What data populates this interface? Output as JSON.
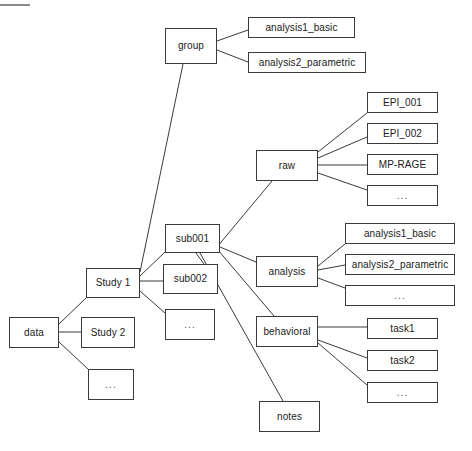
{
  "diagram": {
    "type": "tree",
    "title": "",
    "marker": {
      "name": "top-rule"
    },
    "nodes": [
      {
        "id": "data",
        "label": "data",
        "x": 9,
        "y": 317,
        "w": 50,
        "h": 31
      },
      {
        "id": "study1",
        "label": "Study 1",
        "x": 86,
        "y": 268,
        "w": 54,
        "h": 30
      },
      {
        "id": "study2",
        "label": "Study 2",
        "x": 81,
        "y": 317,
        "w": 54,
        "h": 31
      },
      {
        "id": "data-ellipsis",
        "label": "...",
        "x": 88,
        "y": 369,
        "w": 46,
        "h": 31
      },
      {
        "id": "group",
        "label": "group",
        "x": 165,
        "y": 28,
        "w": 52,
        "h": 36
      },
      {
        "id": "group-analysis1",
        "label": "analysis1_basic",
        "x": 248,
        "y": 17,
        "w": 107,
        "h": 21
      },
      {
        "id": "group-analysis2",
        "label": "analysis2_parametric",
        "x": 248,
        "y": 52,
        "w": 118,
        "h": 21
      },
      {
        "id": "sub001",
        "label": "sub001",
        "x": 165,
        "y": 224,
        "w": 55,
        "h": 29
      },
      {
        "id": "sub002",
        "label": "sub002",
        "x": 163,
        "y": 264,
        "w": 55,
        "h": 30
      },
      {
        "id": "study1-ellipsis",
        "label": "...",
        "x": 165,
        "y": 309,
        "w": 50,
        "h": 31
      },
      {
        "id": "raw",
        "label": "raw",
        "x": 256,
        "y": 150,
        "w": 62,
        "h": 31
      },
      {
        "id": "raw-epi001",
        "label": "EPI_001",
        "x": 367,
        "y": 92,
        "w": 71,
        "h": 21
      },
      {
        "id": "raw-epi002",
        "label": "EPI_002",
        "x": 367,
        "y": 123,
        "w": 71,
        "h": 21
      },
      {
        "id": "raw-mprage",
        "label": "MP-RAGE",
        "x": 367,
        "y": 154,
        "w": 71,
        "h": 21
      },
      {
        "id": "raw-ellipsis",
        "label": "...",
        "x": 367,
        "y": 185,
        "w": 71,
        "h": 21
      },
      {
        "id": "analysis",
        "label": "analysis",
        "x": 256,
        "y": 256,
        "w": 62,
        "h": 31
      },
      {
        "id": "analysis-analysis1",
        "label": "analysis1_basic",
        "x": 345,
        "y": 223,
        "w": 110,
        "h": 21
      },
      {
        "id": "analysis-analysis2",
        "label": "analysis2_parametric",
        "x": 345,
        "y": 254,
        "w": 110,
        "h": 21
      },
      {
        "id": "analysis-ellipsis",
        "label": "...",
        "x": 345,
        "y": 285,
        "w": 110,
        "h": 21
      },
      {
        "id": "behavioral",
        "label": "behavioral",
        "x": 256,
        "y": 316,
        "w": 62,
        "h": 31
      },
      {
        "id": "behavioral-task1",
        "label": "task1",
        "x": 367,
        "y": 318,
        "w": 71,
        "h": 21
      },
      {
        "id": "behavioral-task2",
        "label": "task2",
        "x": 367,
        "y": 350,
        "w": 71,
        "h": 21
      },
      {
        "id": "behavioral-ellipsis",
        "label": "...",
        "x": 367,
        "y": 382,
        "w": 71,
        "h": 21
      },
      {
        "id": "notes",
        "label": "notes",
        "x": 259,
        "y": 401,
        "w": 61,
        "h": 31
      }
    ],
    "edges": [
      {
        "from": "data",
        "to": "study1",
        "x1": 59,
        "y1": 324,
        "x2": 86,
        "y2": 298
      },
      {
        "from": "data",
        "to": "study2",
        "x1": 59,
        "y1": 332,
        "x2": 81,
        "y2": 332
      },
      {
        "from": "data",
        "to": "data-ellipsis",
        "x1": 59,
        "y1": 342,
        "x2": 88,
        "y2": 369
      },
      {
        "from": "study1",
        "to": "group",
        "x1": 140,
        "y1": 272,
        "x2": 183,
        "y2": 64
      },
      {
        "from": "study1",
        "to": "sub001",
        "x1": 140,
        "y1": 276,
        "x2": 165,
        "y2": 252
      },
      {
        "from": "study1",
        "to": "sub002",
        "x1": 140,
        "y1": 281,
        "x2": 163,
        "y2": 281
      },
      {
        "from": "study1",
        "to": "study1-ellipsis",
        "x1": 140,
        "y1": 291,
        "x2": 165,
        "y2": 313
      },
      {
        "from": "group",
        "to": "group-analysis1",
        "x1": 217,
        "y1": 41,
        "x2": 248,
        "y2": 30
      },
      {
        "from": "group",
        "to": "group-analysis2",
        "x1": 217,
        "y1": 50,
        "x2": 248,
        "y2": 62
      },
      {
        "from": "sub001",
        "to": "raw",
        "x1": 212,
        "y1": 253,
        "x2": 272,
        "y2": 181
      },
      {
        "from": "sub001",
        "to": "analysis",
        "x1": 220,
        "y1": 247,
        "x2": 256,
        "y2": 262
      },
      {
        "from": "sub001",
        "to": "behavioral",
        "x1": 218,
        "y1": 250,
        "x2": 274,
        "y2": 316
      },
      {
        "from": "sub001",
        "to": "notes",
        "x1": 200,
        "y1": 253,
        "x2": 283,
        "y2": 401
      },
      {
        "from": "sub001",
        "to": "sub002-link",
        "x1": 196,
        "y1": 253,
        "x2": 204,
        "y2": 264
      },
      {
        "from": "raw",
        "to": "raw-epi001",
        "x1": 318,
        "y1": 152,
        "x2": 367,
        "y2": 113
      },
      {
        "from": "raw",
        "to": "raw-epi002",
        "x1": 318,
        "y1": 158,
        "x2": 367,
        "y2": 137
      },
      {
        "from": "raw",
        "to": "raw-mprage",
        "x1": 318,
        "y1": 165,
        "x2": 367,
        "y2": 165
      },
      {
        "from": "raw",
        "to": "raw-ellipsis",
        "x1": 318,
        "y1": 173,
        "x2": 367,
        "y2": 190
      },
      {
        "from": "analysis",
        "to": "analysis-analysis1",
        "x1": 318,
        "y1": 266,
        "x2": 345,
        "y2": 244
      },
      {
        "from": "analysis",
        "to": "analysis-analysis2",
        "x1": 318,
        "y1": 270,
        "x2": 345,
        "y2": 265
      },
      {
        "from": "analysis",
        "to": "analysis-ellipsis",
        "x1": 318,
        "y1": 278,
        "x2": 345,
        "y2": 288
      },
      {
        "from": "behavioral",
        "to": "behavioral-task1",
        "x1": 318,
        "y1": 327,
        "x2": 367,
        "y2": 327
      },
      {
        "from": "behavioral",
        "to": "behavioral-task2",
        "x1": 318,
        "y1": 340,
        "x2": 367,
        "y2": 358
      },
      {
        "from": "behavioral",
        "to": "behavioral-ellipsis",
        "x1": 318,
        "y1": 343,
        "x2": 367,
        "y2": 385
      }
    ],
    "style": {
      "box_border_color": "#3a3a3a",
      "box_fill_color": "#ffffff",
      "edge_color": "#3a3a3a",
      "text_color": "#1a1a1a",
      "background_color": "#ffffff"
    }
  }
}
